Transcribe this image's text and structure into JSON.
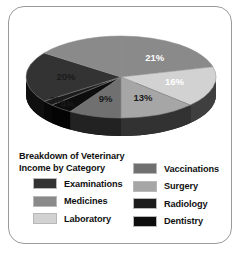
{
  "chart_data": {
    "type": "pie",
    "title": "Breakdown of Veterinary Income by Category",
    "title_line1": "Breakdown of Veterinary",
    "title_line2": "Income by Category",
    "style": "3d-pie",
    "legend_position": "bottom",
    "grid": false,
    "unit": "%",
    "categories": [
      "Examinations",
      "Medicines",
      "Laboratory",
      "Vaccinations",
      "Surgery",
      "Radiology",
      "Dentistry"
    ],
    "values": [
      20,
      21,
      16,
      9,
      13,
      2,
      4
    ],
    "slices": [
      {
        "label": "21%",
        "value": 21,
        "category": "Medicines",
        "color": "#8a8a8a",
        "label_color": "dark"
      },
      {
        "label": "16%",
        "value": 16,
        "category": "Laboratory",
        "color": "#d2d2d2",
        "label_color": "dark"
      },
      {
        "label": "13%",
        "value": 13,
        "category": "Surgery",
        "color": "#a6a6a6",
        "label_color": "light"
      },
      {
        "label": "9%",
        "value": 9,
        "category": "Vaccinations",
        "color": "#707070",
        "label_color": "light"
      },
      {
        "label": "4%",
        "value": 4,
        "category": "Dentistry",
        "color": "#0d0d0d",
        "label_color": "light"
      },
      {
        "label": "2%",
        "value": 2,
        "category": "Radiology",
        "color": "#1c1c1c",
        "label_color": "light"
      },
      {
        "label": "20%",
        "value": 20,
        "category": "Examinations",
        "color": "#333333",
        "label_color": "light"
      },
      {
        "label": "",
        "value": 15,
        "category": "Medicines",
        "color": "#8a8a8a",
        "label_color": "dark"
      }
    ],
    "side_wall_color": "#111111",
    "colors": {
      "examinations": "#333333",
      "medicines": "#8a8a8a",
      "laboratory": "#d2d2d2",
      "vaccinations": "#707070",
      "surgery": "#a6a6a6",
      "radiology": "#1c1c1c",
      "dentistry": "#0d0d0d",
      "border": "#9a9a9a",
      "background": "#ffffff",
      "text": "#111111"
    }
  },
  "legend": {
    "title_line1": "Breakdown of Veterinary",
    "title_line2": "Income by Category",
    "left_column": [
      {
        "label": "Examinations",
        "color": "#333333"
      },
      {
        "label": "Medicines",
        "color": "#8a8a8a"
      },
      {
        "label": "Laboratory",
        "color": "#d2d2d2"
      }
    ],
    "right_column": [
      {
        "label": "Vaccinations",
        "color": "#707070"
      },
      {
        "label": "Surgery",
        "color": "#a6a6a6"
      },
      {
        "label": "Radiology",
        "color": "#1c1c1c"
      },
      {
        "label": "Dentistry",
        "color": "#0d0d0d"
      }
    ]
  }
}
